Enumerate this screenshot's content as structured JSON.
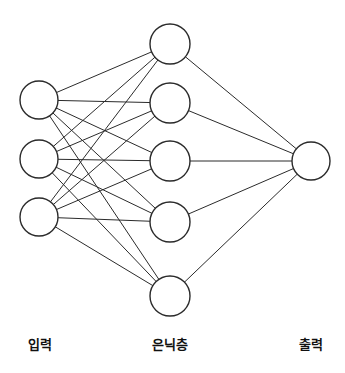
{
  "diagram": {
    "kind": "neural-network-diagram",
    "background_color": "#ffffff",
    "stroke_color": "#2b2b2b",
    "node_fill_color": "#ffffff",
    "label_color": "#111111",
    "canvas": {
      "width": 345,
      "height": 373
    },
    "layers": [
      {
        "id": "input",
        "label": "입력",
        "label_x": 40,
        "label_y": 349,
        "node_radius": 19,
        "nodes": [
          {
            "name": "input-node-1",
            "cx": 39,
            "cy": 100
          },
          {
            "name": "input-node-2",
            "cx": 39,
            "cy": 159
          },
          {
            "name": "input-node-3",
            "cx": 39,
            "cy": 217
          }
        ]
      },
      {
        "id": "hidden",
        "label": "은닉층",
        "label_x": 170,
        "label_y": 349,
        "node_radius": 20,
        "nodes": [
          {
            "name": "hidden-node-1",
            "cx": 170,
            "cy": 44
          },
          {
            "name": "hidden-node-2",
            "cx": 170,
            "cy": 103
          },
          {
            "name": "hidden-node-3",
            "cx": 170,
            "cy": 161
          },
          {
            "name": "hidden-node-4",
            "cx": 170,
            "cy": 222
          },
          {
            "name": "hidden-node-5",
            "cx": 170,
            "cy": 296
          }
        ]
      },
      {
        "id": "output",
        "label": "출력",
        "label_x": 311,
        "label_y": 349,
        "node_radius": 19,
        "nodes": [
          {
            "name": "output-node-1",
            "cx": 311,
            "cy": 161
          }
        ]
      }
    ],
    "edges": [
      {
        "from": "input-node-1",
        "to": "hidden-node-1"
      },
      {
        "from": "input-node-1",
        "to": "hidden-node-2"
      },
      {
        "from": "input-node-1",
        "to": "hidden-node-3"
      },
      {
        "from": "input-node-1",
        "to": "hidden-node-4"
      },
      {
        "from": "input-node-1",
        "to": "hidden-node-5"
      },
      {
        "from": "input-node-2",
        "to": "hidden-node-1"
      },
      {
        "from": "input-node-2",
        "to": "hidden-node-2"
      },
      {
        "from": "input-node-2",
        "to": "hidden-node-3"
      },
      {
        "from": "input-node-2",
        "to": "hidden-node-4"
      },
      {
        "from": "input-node-2",
        "to": "hidden-node-5"
      },
      {
        "from": "input-node-3",
        "to": "hidden-node-1"
      },
      {
        "from": "input-node-3",
        "to": "hidden-node-2"
      },
      {
        "from": "input-node-3",
        "to": "hidden-node-3"
      },
      {
        "from": "input-node-3",
        "to": "hidden-node-4"
      },
      {
        "from": "input-node-3",
        "to": "hidden-node-5"
      },
      {
        "from": "hidden-node-1",
        "to": "output-node-1"
      },
      {
        "from": "hidden-node-2",
        "to": "output-node-1"
      },
      {
        "from": "hidden-node-3",
        "to": "output-node-1"
      },
      {
        "from": "hidden-node-4",
        "to": "output-node-1"
      },
      {
        "from": "hidden-node-5",
        "to": "output-node-1"
      }
    ]
  }
}
